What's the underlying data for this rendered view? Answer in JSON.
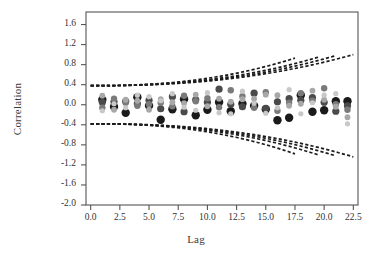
{
  "chart_data": {
    "type": "scatter",
    "title": "",
    "xlabel": "Lag",
    "ylabel": "Correlation",
    "xlim": [
      -0.4,
      22.9
    ],
    "ylim": [
      -2.0,
      1.85
    ],
    "grid": false,
    "legend": "none",
    "xticks": [
      "0.0",
      "2.5",
      "5.0",
      "7.5",
      "10.0",
      "12.5",
      "15.0",
      "17.5",
      "20.0",
      "22.5"
    ],
    "xtick_values": [
      0.0,
      2.5,
      5.0,
      7.5,
      10.0,
      12.5,
      15.0,
      17.5,
      20.0,
      22.5
    ],
    "yticks": [
      "1.6",
      "1.2",
      "0.8",
      "0.4",
      "0.0",
      "-0.4",
      "-0.8",
      "-1.2",
      "-1.6",
      "-2.0"
    ],
    "ytick_values": [
      1.6,
      1.2,
      0.8,
      0.4,
      0.0,
      -0.4,
      -0.8,
      -1.2,
      -1.6,
      -2.0
    ],
    "series": [
      {
        "name": "series-1",
        "color": "#1a1a1a",
        "marker_size": 4.2,
        "x": [
          1,
          2,
          3,
          4,
          5,
          6,
          7,
          8,
          9,
          10,
          11,
          12,
          13,
          14,
          15,
          16,
          17,
          18,
          19,
          20,
          21,
          22
        ],
        "y": [
          0.1,
          -0.04,
          -0.16,
          0.15,
          -0.02,
          -0.3,
          -0.09,
          0.11,
          -0.21,
          -0.1,
          0.05,
          -0.13,
          0.02,
          -0.02,
          -0.09,
          -0.31,
          -0.26,
          0.19,
          -0.14,
          -0.11,
          0.07,
          0.07
        ]
      },
      {
        "name": "series-2",
        "color": "#4a4a4a",
        "marker_size": 3.6,
        "x": [
          1,
          2,
          3,
          4,
          5,
          6,
          7,
          8,
          9,
          10,
          11,
          12,
          13,
          14,
          15,
          16,
          17,
          18,
          19,
          20,
          21,
          22
        ],
        "y": [
          0.05,
          0.06,
          0.07,
          0.02,
          0.09,
          -0.08,
          0.16,
          -0.14,
          0.1,
          0.05,
          0.31,
          0.01,
          -0.04,
          0.23,
          -0.07,
          0.06,
          0.12,
          0.09,
          0.14,
          0.05,
          -0.13,
          -0.02
        ]
      },
      {
        "name": "series-3",
        "color": "#7a7a7a",
        "marker_size": 3.2,
        "x": [
          1,
          2,
          3,
          4,
          5,
          6,
          7,
          8,
          9,
          10,
          11,
          12,
          13,
          14,
          15,
          16,
          17,
          18,
          19,
          20,
          21,
          22
        ],
        "y": [
          -0.06,
          0.12,
          0.04,
          -0.02,
          0.01,
          0.04,
          -0.03,
          0.18,
          0.07,
          0.13,
          -0.05,
          0.29,
          0.17,
          -0.06,
          0.25,
          -0.12,
          0.04,
          0.23,
          0.08,
          0.33,
          0.01,
          -0.1
        ]
      },
      {
        "name": "series-4",
        "color": "#a8a8a8",
        "marker_size": 2.9,
        "x": [
          1,
          2,
          3,
          4,
          5,
          6,
          7,
          8,
          9,
          10,
          11,
          12,
          13,
          14,
          15,
          16,
          17,
          18,
          19,
          20,
          21,
          22
        ],
        "y": [
          0.18,
          -0.1,
          0.1,
          0.08,
          -0.1,
          0.11,
          0.05,
          0.03,
          0.2,
          -0.03,
          0.12,
          0.06,
          0.11,
          0.12,
          0.2,
          0.19,
          -0.02,
          0.02,
          0.28,
          0.1,
          -0.04,
          -0.25
        ]
      },
      {
        "name": "series-5",
        "color": "#c8c8c8",
        "marker_size": 2.6,
        "x": [
          1,
          2,
          3,
          4,
          5,
          6,
          7,
          8,
          9,
          10,
          11,
          12,
          13,
          14,
          15,
          16,
          17,
          18,
          19,
          20,
          21,
          22
        ],
        "y": [
          -0.12,
          0.02,
          -0.06,
          0.19,
          0.16,
          0.08,
          0.22,
          -0.05,
          -0.11,
          0.24,
          -0.16,
          -0.18,
          0.27,
          0.03,
          -0.17,
          -0.06,
          0.3,
          -0.18,
          0.04,
          0.19,
          0.22,
          -0.38
        ]
      }
    ],
    "confidence_bands": {
      "style": "dashed",
      "color": "#1c1c1c",
      "description": "Four pairs of symmetric diverging confidence limit curves",
      "upper_curves": [
        {
          "name": "band-upper-1",
          "x0_value": 0.38,
          "x_end": 22.5,
          "y_end": 1.0
        },
        {
          "name": "band-upper-2",
          "x0_value": 0.38,
          "x_end": 21.0,
          "y_end": 0.98
        },
        {
          "name": "band-upper-3",
          "x0_value": 0.38,
          "x_end": 19.5,
          "y_end": 0.95
        },
        {
          "name": "band-upper-4",
          "x0_value": 0.38,
          "x_end": 17.5,
          "y_end": 0.93
        }
      ],
      "lower_curves": [
        {
          "name": "band-lower-1",
          "x0_value": -0.38,
          "x_end": 22.5,
          "y_end": -1.04
        },
        {
          "name": "band-lower-2",
          "x0_value": -0.38,
          "x_end": 21.0,
          "y_end": -1.02
        },
        {
          "name": "band-lower-3",
          "x0_value": -0.38,
          "x_end": 19.5,
          "y_end": -1.0
        },
        {
          "name": "band-lower-4",
          "x0_value": -0.38,
          "x_end": 17.5,
          "y_end": -0.98
        }
      ]
    },
    "axis_color": "#555555",
    "frame": {
      "left": 86,
      "top": 12,
      "right": 358,
      "bottom": 205
    }
  }
}
